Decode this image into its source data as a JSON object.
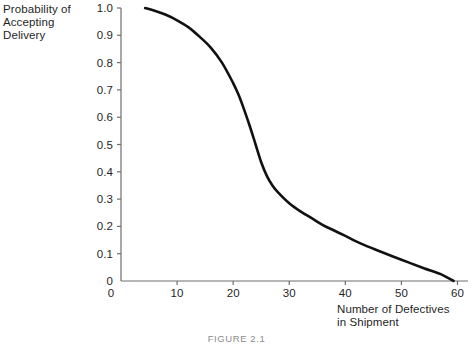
{
  "figure": {
    "caption": "FIGURE 2.1",
    "background_color": "#ffffff",
    "curve_color": "#111111",
    "axis_color": "#6e6e6e"
  },
  "axes": {
    "y_axis_title": "Probability of\nAccepting\nDelivery",
    "x_axis_title": "Number of Defectives\nin Shipment",
    "y_ticks": [
      "1.0",
      "0.9",
      "0.8",
      "0.7",
      "0.6",
      "0.5",
      "0.4",
      "0.3",
      "0.2",
      "0.1",
      "0"
    ],
    "x_ticks": [
      "0",
      "10",
      "20",
      "30",
      "40",
      "50",
      "60"
    ]
  },
  "chart_data": {
    "type": "line",
    "title": "FIGURE 2.1",
    "xlabel": "Number of Defectives in Shipment",
    "ylabel": "Probability of Accepting Delivery",
    "xlim": [
      0,
      62
    ],
    "ylim": [
      0,
      1.0
    ],
    "grid": false,
    "legend": null,
    "x_tick_values": [
      0,
      10,
      20,
      30,
      40,
      50,
      60
    ],
    "y_tick_values": [
      0,
      0.1,
      0.2,
      0.3,
      0.4,
      0.5,
      0.6,
      0.7,
      0.8,
      0.9,
      1.0
    ],
    "series": [
      {
        "name": "Operating characteristic curve",
        "x": [
          4.3,
          6,
          8,
          10,
          12,
          14,
          16,
          18,
          20,
          21,
          22,
          23,
          24,
          25,
          26,
          27,
          28,
          30,
          32,
          34,
          36,
          38,
          40,
          43,
          46,
          50,
          54,
          57,
          59.3
        ],
        "y": [
          1.0,
          0.99,
          0.975,
          0.955,
          0.93,
          0.895,
          0.855,
          0.8,
          0.725,
          0.68,
          0.625,
          0.565,
          0.5,
          0.435,
          0.385,
          0.35,
          0.325,
          0.285,
          0.255,
          0.23,
          0.205,
          0.185,
          0.165,
          0.135,
          0.11,
          0.078,
          0.047,
          0.025,
          0.0
        ]
      }
    ]
  }
}
